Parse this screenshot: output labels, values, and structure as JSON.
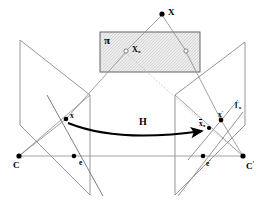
{
  "figure": {
    "background_color": "#ffffff",
    "line_color": "#808080",
    "dark_line_color": "#000000",
    "plane_fill": "#e8e8e8",
    "width": 264,
    "height": 213
  },
  "labels": {
    "scene_point": "X",
    "plane_name": "π",
    "plane_point_base": "X",
    "plane_point_sub": "π",
    "left_image_point": "x",
    "left_camera_centre": "C",
    "left_epipole": "e",
    "homography": "H",
    "transferred_point_base": "x",
    "transferred_point_sub": "π",
    "right_image_point": "x",
    "right_image_point_prime": "′",
    "epipolar_line_base": "l",
    "epipolar_line_prime": "′",
    "epipolar_line_sub": "x",
    "right_epipole": "e",
    "right_epipole_prime": "′",
    "right_camera_centre": "C",
    "right_camera_centre_prime": "′"
  },
  "geometry": {
    "scene_point_xy": [
      162,
      14
    ],
    "plane_rect": [
      100,
      32,
      100,
      40
    ],
    "plane_point_pi_xy": [
      126,
      51
    ],
    "plane_point_right_xy": [
      186,
      51
    ],
    "left_plane_corners": [
      [
        20,
        40
      ],
      [
        90,
        95
      ],
      [
        90,
        195
      ],
      [
        20,
        125
      ]
    ],
    "right_plane_corners": [
      [
        245,
        42
      ],
      [
        175,
        95
      ],
      [
        175,
        195
      ],
      [
        245,
        125
      ]
    ],
    "left_image_point_xy": [
      66,
      119
    ],
    "left_camera_xy": [
      19,
      156
    ],
    "left_epipole_xy": [
      74,
      156
    ],
    "right_camera_xy": [
      243,
      156
    ],
    "right_epipole_xy": [
      203,
      156
    ],
    "transferred_point_xy": [
      209,
      128
    ],
    "right_image_point_xy": [
      221,
      120
    ],
    "baseline_y": 156,
    "arrow_start_xy": [
      68,
      124
    ],
    "arrow_end_xy": [
      206,
      131
    ]
  }
}
